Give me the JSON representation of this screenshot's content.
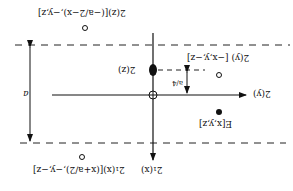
{
  "diagram": {
    "orientation": "rotated 180 degrees",
    "labels": {
      "top_point": "2(z)[(−a/2−x),−y,z]",
      "right_open_point": "2(y) [−x,y,−z]",
      "axis_y": "2(y)",
      "axis_x": "2₁(x)",
      "axis_z_point": "2(z)",
      "fraction": "a/4",
      "general_point": "E[x,y,z]",
      "bottom_point": "2₁(x)[(x+a/2),−y,−z]",
      "cell_length": "a"
    },
    "colors": {
      "ink": "#111111",
      "background": "#ffffff"
    }
  }
}
